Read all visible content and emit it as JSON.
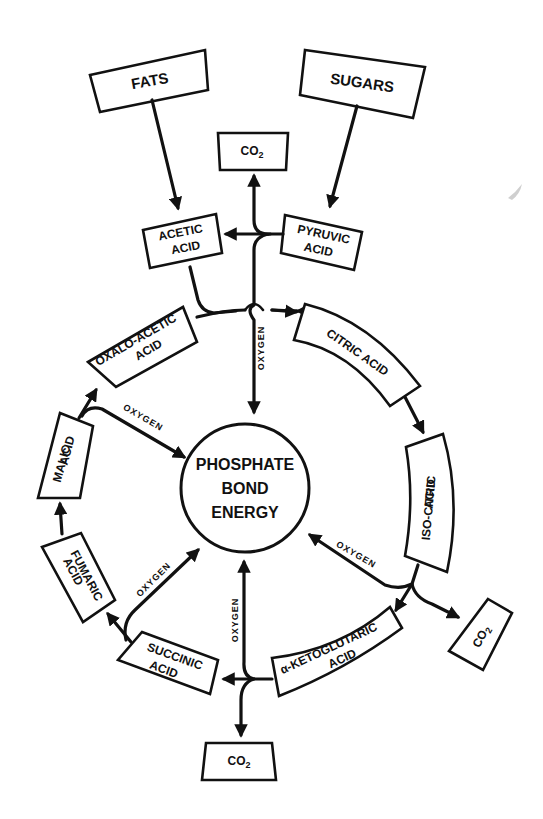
{
  "diagram": {
    "type": "metabolic-cycle",
    "center": {
      "lines": [
        "PHOSPHATE",
        "BOND",
        "ENERGY"
      ]
    },
    "sources": [
      {
        "id": "fats",
        "label": "FATS"
      },
      {
        "id": "sugars",
        "label": "SUGARS"
      }
    ],
    "intermediates": [
      {
        "id": "acetic",
        "lines": [
          "ACETIC",
          "ACID"
        ]
      },
      {
        "id": "pyruvic",
        "lines": [
          "PYRUVIC",
          "ACID"
        ]
      }
    ],
    "cycle": [
      {
        "id": "citric",
        "lines": [
          "CITRIC ACID"
        ]
      },
      {
        "id": "isocitric",
        "lines": [
          "ISO-CITRIC",
          "ACID"
        ]
      },
      {
        "id": "ketoglutaric",
        "lines": [
          "α-KETOGLUTARIC",
          "ACID"
        ]
      },
      {
        "id": "succinic",
        "lines": [
          "SUCCINIC",
          "ACID"
        ]
      },
      {
        "id": "fumaric",
        "lines": [
          "FUMARIC",
          "ACID"
        ]
      },
      {
        "id": "malic",
        "lines": [
          "MALIC",
          "ACID"
        ]
      },
      {
        "id": "oxaloacetic",
        "lines": [
          "OXALO-ACETIC",
          "ACID"
        ]
      }
    ],
    "co2": {
      "label": "CO",
      "subscript": "2"
    },
    "oxygen_label": "OXYGEN",
    "edges": [
      {
        "from": "FATS",
        "to": "ACETIC ACID"
      },
      {
        "from": "SUGARS",
        "to": "PYRUVIC ACID"
      },
      {
        "from": "PYRUVIC ACID",
        "to": "ACETIC ACID"
      },
      {
        "from": "PYRUVIC ACID",
        "to": "CO2"
      },
      {
        "from": "ACETIC ACID",
        "to": "CITRIC ACID",
        "via": "OXALO-ACETIC ACID"
      },
      {
        "from": "CITRIC ACID",
        "to": "ISO-CITRIC ACID"
      },
      {
        "from": "ISO-CITRIC ACID",
        "to": "α-KETOGLUTARIC ACID"
      },
      {
        "from": "ISO-CITRIC ACID",
        "to": "CO2"
      },
      {
        "from": "ISO-CITRIC ACID",
        "to": "PHOSPHATE BOND ENERGY",
        "label": "OXYGEN"
      },
      {
        "from": "α-KETOGLUTARIC ACID",
        "to": "SUCCINIC ACID"
      },
      {
        "from": "α-KETOGLUTARIC ACID",
        "to": "CO2"
      },
      {
        "from": "α-KETOGLUTARIC ACID",
        "to": "PHOSPHATE BOND ENERGY",
        "label": "OXYGEN"
      },
      {
        "from": "SUCCINIC ACID",
        "to": "FUMARIC ACID"
      },
      {
        "from": "SUCCINIC ACID",
        "to": "PHOSPHATE BOND ENERGY",
        "label": "OXYGEN"
      },
      {
        "from": "FUMARIC ACID",
        "to": "MALIC ACID"
      },
      {
        "from": "MALIC ACID",
        "to": "OXALO-ACETIC ACID"
      },
      {
        "from": "MALIC ACID",
        "to": "PHOSPHATE BOND ENERGY",
        "label": "OXYGEN"
      },
      {
        "from": "PYRUVIC ACID",
        "to": "PHOSPHATE BOND ENERGY",
        "label": "OXYGEN"
      }
    ]
  }
}
